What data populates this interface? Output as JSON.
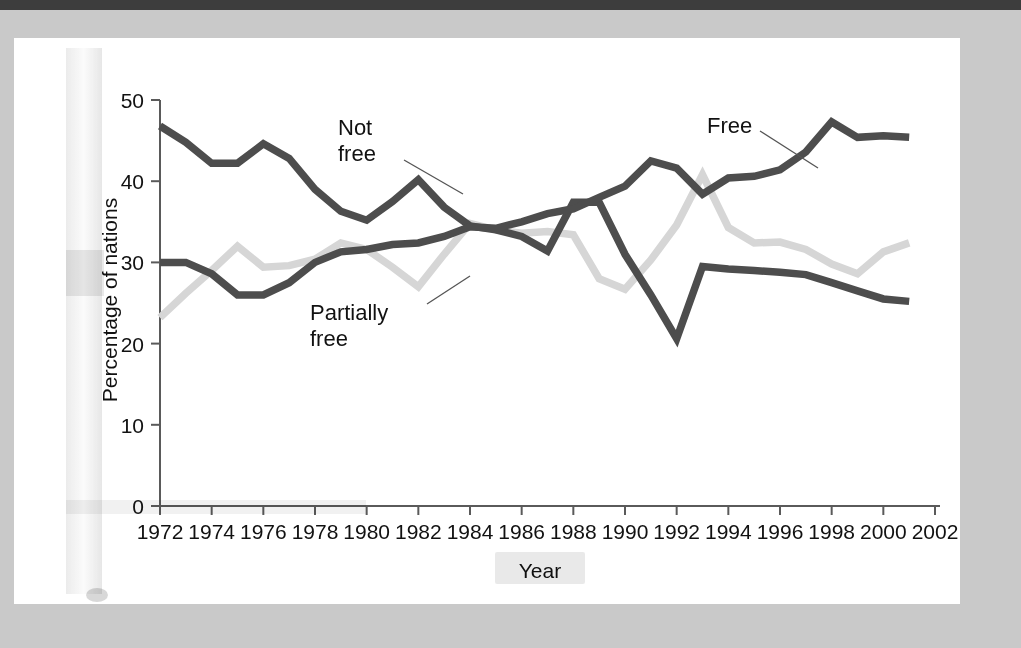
{
  "figure": {
    "background_color": "#c9c9c9",
    "page_color": "#ffffff",
    "top_bar_color": "#3d3d3d"
  },
  "axis": {
    "y_title": "Percentage of nations",
    "x_title": "Year",
    "y_ticks": [
      "0",
      "10",
      "20",
      "30",
      "40",
      "50"
    ],
    "x_ticks": [
      "1972",
      "1974",
      "1976",
      "1978",
      "1980",
      "1982",
      "1984",
      "1986",
      "1988",
      "1990",
      "1992",
      "1994",
      "1996",
      "1998",
      "2000",
      "2002"
    ]
  },
  "annotations": [
    {
      "name": "not-free",
      "line1": "Not",
      "line2": "free"
    },
    {
      "name": "partially-free",
      "line1": "Partially",
      "line2": "free"
    },
    {
      "name": "free",
      "line1": "Free",
      "line2": ""
    }
  ],
  "chart_data": {
    "type": "line",
    "title": "",
    "xlabel": "Year",
    "ylabel": "Percentage of nations",
    "xlim": [
      1972,
      2002
    ],
    "ylim": [
      0,
      50
    ],
    "grid": false,
    "legend": "inline-annotations",
    "x": [
      1972,
      1973,
      1974,
      1975,
      1976,
      1977,
      1978,
      1979,
      1980,
      1981,
      1982,
      1983,
      1984,
      1985,
      1986,
      1987,
      1988,
      1989,
      1990,
      1991,
      1992,
      1993,
      1994,
      1995,
      1996,
      1997,
      1998,
      1999,
      2000,
      2001
    ],
    "series": [
      {
        "name": "Not free",
        "color": "#4d4d4d",
        "values": [
          46.8,
          44.8,
          42.2,
          42.2,
          44.6,
          42.8,
          39.0,
          36.3,
          35.2,
          37.5,
          40.2,
          36.8,
          34.5,
          34.0,
          33.2,
          31.4,
          37.4,
          37.4,
          31.0,
          26.0,
          20.6,
          29.5,
          29.2,
          29.0,
          28.8,
          28.5,
          27.5,
          26.5,
          25.5,
          25.2
        ]
      },
      {
        "name": "Partially free",
        "color": "#d6d6d6",
        "values": [
          23.2,
          26.2,
          29.0,
          32.0,
          29.4,
          29.6,
          30.4,
          32.4,
          31.6,
          29.4,
          27.0,
          31.0,
          34.8,
          34.0,
          33.6,
          33.8,
          33.4,
          28.0,
          26.7,
          30.3,
          34.6,
          40.8,
          34.3,
          32.4,
          32.5,
          31.6,
          29.8,
          28.6,
          31.3,
          32.4
        ]
      },
      {
        "name": "Free",
        "color": "#4d4d4d",
        "values": [
          30.0,
          30.0,
          28.6,
          26.0,
          26.0,
          27.5,
          30.0,
          31.3,
          31.6,
          32.2,
          32.4,
          33.2,
          34.4,
          34.2,
          35.0,
          36.0,
          36.6,
          38.0,
          39.4,
          42.5,
          41.6,
          38.4,
          40.4,
          40.6,
          41.4,
          43.6,
          47.3,
          45.4,
          45.6,
          45.4
        ]
      }
    ]
  }
}
